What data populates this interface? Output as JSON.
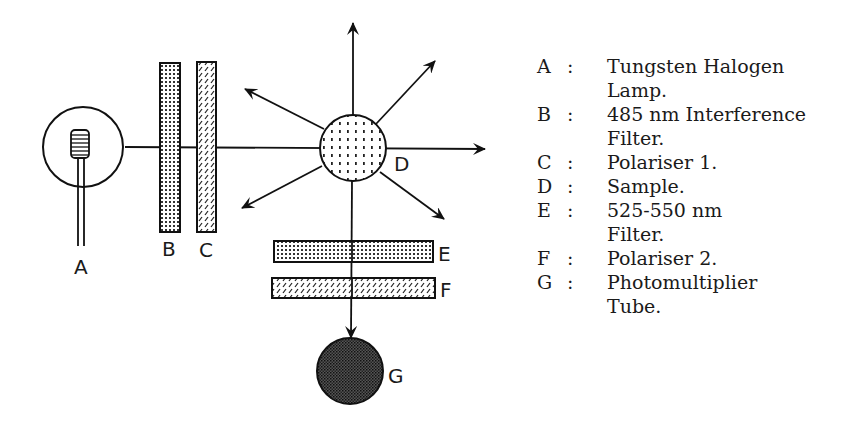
{
  "diagram": {
    "labels": {
      "A": "A",
      "B": "B",
      "C": "C",
      "D": "D",
      "E": "E",
      "F": "F",
      "G": "G"
    }
  },
  "legend": {
    "separator": ":",
    "items": [
      {
        "key": "A",
        "description": "Tungsten Halogen\nLamp."
      },
      {
        "key": "B",
        "description": "485 nm Interference\nFilter."
      },
      {
        "key": "C",
        "description": "Polariser 1."
      },
      {
        "key": "D",
        "description": "Sample."
      },
      {
        "key": "E",
        "description": "525-550 nm\nFilter."
      },
      {
        "key": "F",
        "description": "Polariser 2."
      },
      {
        "key": "G",
        "description": "Photomultiplier\nTube."
      }
    ]
  }
}
